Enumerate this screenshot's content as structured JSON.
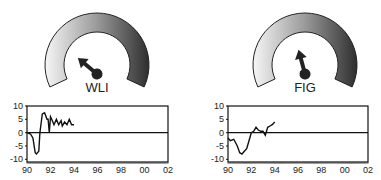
{
  "gauges": [
    {
      "label": "WLI",
      "needle_angle_deg": -50,
      "cx": 97,
      "cy": 65
    },
    {
      "label": "FIG",
      "needle_angle_deg": -15,
      "cx": 305,
      "cy": 65
    }
  ],
  "colors": {
    "gauge_light": "#f4f4f4",
    "gauge_dark": "#333333",
    "line": "#111111"
  },
  "chart_data": [
    {
      "type": "line",
      "title": "WLI",
      "xlabel": "",
      "ylabel": "",
      "x_ticks": [
        "90",
        "92",
        "94",
        "96",
        "98",
        "00",
        "02"
      ],
      "y_ticks": [
        "10",
        "5",
        "0",
        "-5",
        "-10"
      ],
      "xlim": [
        1990,
        2002
      ],
      "ylim": [
        -11,
        10
      ],
      "grid": false,
      "series": [
        {
          "name": "WLI",
          "x": [
            1990,
            1990.3,
            1990.5,
            1990.7,
            1990.8,
            1991,
            1991.1,
            1991.3,
            1991.5,
            1991.7,
            1991.8,
            1991.9,
            1992,
            1992.1,
            1992.3,
            1992.5,
            1992.7,
            1992.9,
            1993,
            1993.2,
            1993.4,
            1993.6,
            1993.8,
            1994
          ],
          "values": [
            0,
            -0.5,
            -2,
            -7.5,
            -8,
            -7,
            0,
            7,
            7.5,
            5,
            5,
            0,
            6,
            5,
            3,
            5,
            3,
            4.5,
            2.5,
            4,
            3,
            5,
            3,
            3
          ]
        }
      ]
    },
    {
      "type": "line",
      "title": "FIG",
      "xlabel": "",
      "ylabel": "",
      "x_ticks": [
        "90",
        "92",
        "94",
        "96",
        "98",
        "00",
        "02"
      ],
      "y_ticks": [
        "10",
        "5",
        "0",
        "-5",
        "-10"
      ],
      "xlim": [
        1990,
        2002
      ],
      "ylim": [
        -11,
        10
      ],
      "grid": false,
      "series": [
        {
          "name": "FIG",
          "x": [
            1990,
            1990.2,
            1990.5,
            1990.8,
            1991,
            1991.2,
            1991.4,
            1991.6,
            1991.8,
            1992,
            1992.2,
            1992.4,
            1992.6,
            1992.8,
            1993,
            1993.2,
            1993.4,
            1993.6,
            1993.8,
            1994
          ],
          "values": [
            -2,
            -3,
            -2.5,
            -5,
            -7.5,
            -8,
            -7,
            -6,
            -3,
            0,
            0.5,
            2,
            1,
            0.5,
            0.5,
            -1,
            2,
            2.5,
            3,
            4
          ]
        }
      ]
    }
  ]
}
